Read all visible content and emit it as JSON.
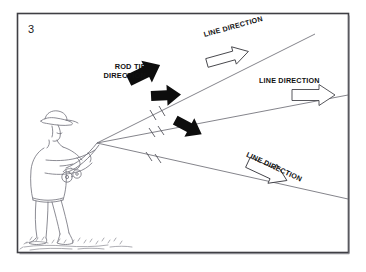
{
  "figure": {
    "panel_number": "3",
    "kind": "fly-casting line and rod tip direction diagram",
    "frame_color": "#3a3a3a",
    "background_color": "#ffffff",
    "ink_color": "#1a1a1a",
    "sketch_color": "#7a7a82"
  },
  "labels": {
    "rod_tip_direction": {
      "line1": "ROD TIP",
      "line2": "DIRECTION"
    },
    "line_direction_upper": "LINE DIRECTION",
    "line_direction_middle": "LINE DIRECTION",
    "line_direction_lower": "LINE DIRECTION"
  },
  "elements": {
    "angler_figure": "angler-casting-sketch",
    "ground_marks": "ground-sketch-marks",
    "rod": "fishing-rod",
    "reel": "fishing-reel",
    "black_arrow_upper": "rod-tip-direction-arrow-upper",
    "black_arrow_middle": "rod-tip-direction-arrow-middle",
    "black_arrow_lower": "rod-tip-direction-arrow-lower",
    "hollow_arrow_upper": "line-direction-arrow-upper",
    "hollow_arrow_middle": "line-direction-arrow-middle",
    "hollow_arrow_lower": "line-direction-arrow-lower",
    "cast_line_upper": "cast-line-upper",
    "cast_line_middle": "cast-line-middle",
    "cast_line_lower": "cast-line-lower",
    "tick_marks": "line-tick-marks"
  }
}
